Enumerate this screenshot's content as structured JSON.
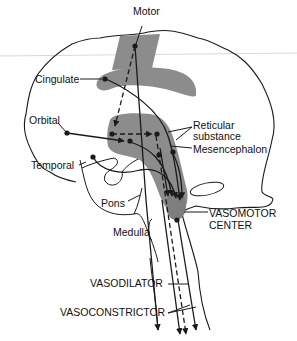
{
  "diagram": {
    "colors": {
      "background": "#ffffff",
      "outline": "#1a1a1a",
      "shading": "#8c8c8c",
      "text": "#111111",
      "scan_line": "#d4d4d4"
    },
    "labels": {
      "motor": "Motor",
      "cingulate": "Cingulate",
      "orbital": "Orbital",
      "temporal": "Temporal",
      "reticular_1": "Reticular",
      "reticular_2": "substance",
      "mesencephalon": "Mesencephalon",
      "pons": "Pons",
      "medulla": "Medulla",
      "vasomotor_1": "VASOMOTOR",
      "vasomotor_2": "CENTER",
      "vasodilator": "VASODILATOR",
      "vasoconstrictor": "VASOCONSTRICTOR"
    }
  }
}
